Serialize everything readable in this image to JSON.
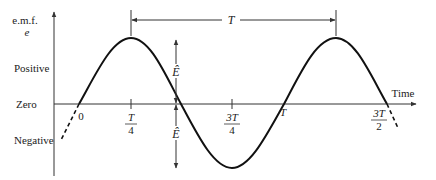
{
  "diagram": {
    "y_axis": {
      "label_line1": "e.m.f.",
      "label_line2": "e",
      "levels": [
        "Positive",
        "Zero",
        "Negative"
      ]
    },
    "x_axis": {
      "label": "Time",
      "ticks": [
        {
          "id": "t0",
          "num": "0",
          "den": ""
        },
        {
          "id": "t1",
          "num": "T",
          "den": "4"
        },
        {
          "id": "t3",
          "num": "3T",
          "den": "4"
        },
        {
          "id": "t4",
          "num": "T",
          "den": ""
        },
        {
          "id": "t6",
          "num": "3T",
          "den": "2"
        }
      ]
    },
    "period_label": "T",
    "amplitude_label": "Ê",
    "colors": {
      "curve": "#111111",
      "axis": "#333333",
      "text": "#222222"
    }
  }
}
